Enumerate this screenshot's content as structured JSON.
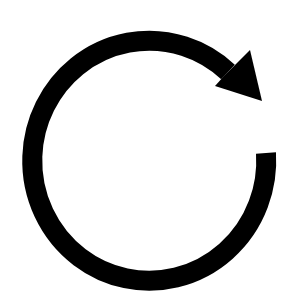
{
  "icon": {
    "name": "refresh-icon",
    "label": "Refresh / reload (clockwise circular arrow)",
    "color": "#000000",
    "background": "#ffffff",
    "direction": "clockwise"
  }
}
